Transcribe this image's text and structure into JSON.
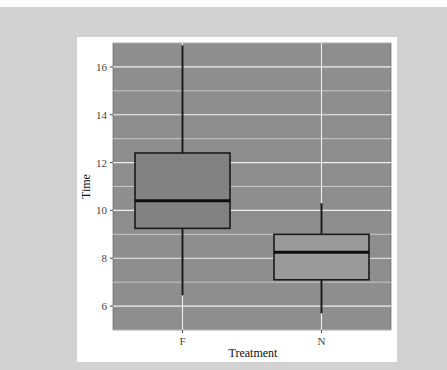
{
  "chart_data": {
    "type": "boxplot",
    "title": "",
    "xlabel": "Treatment",
    "ylabel": "Time",
    "categories": [
      "F",
      "N"
    ],
    "ylim": [
      5.0,
      17.0
    ],
    "yticks": [
      6,
      8,
      10,
      12,
      14,
      16
    ],
    "grid": true,
    "legend": null,
    "series": [
      {
        "name": "F",
        "whisker_low": 6.45,
        "q1": 9.25,
        "median": 10.4,
        "q3": 12.4,
        "whisker_high": 16.9,
        "fill": "#828282"
      },
      {
        "name": "N",
        "whisker_low": 5.7,
        "q1": 7.1,
        "median": 8.25,
        "q3": 9.0,
        "whisker_high": 10.3,
        "fill": "#9a9a9a"
      }
    ]
  },
  "colors": {
    "page_background": "#d2d2d2",
    "card_background": "#ffffff",
    "panel_background": "#8e8e8e",
    "gridline": "#f0f0f0",
    "box_outline": "#1a1a1a"
  }
}
